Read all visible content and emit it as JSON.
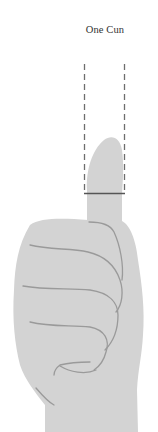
{
  "diagram": {
    "title": "One Cun",
    "colors": {
      "hand_fill": "#d3d3d3",
      "crease_lines": "#999999",
      "guide_lines": "#6e6e6e",
      "text": "#333333"
    }
  }
}
